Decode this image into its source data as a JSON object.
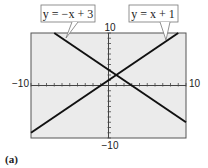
{
  "chart_data": {
    "type": "line",
    "title": "",
    "xlabel": "",
    "ylabel": "",
    "xlim": [
      -10,
      10
    ],
    "ylim": [
      -10,
      10
    ],
    "grid": false,
    "tick_labels": {
      "x_min": "−10",
      "x_max": "10",
      "y_min": "−10",
      "y_max": "10"
    },
    "series": [
      {
        "name": "y = −x + 3",
        "slope": -1,
        "intercept": 3,
        "x": [
          -7,
          10
        ],
        "y": [
          10,
          -7
        ]
      },
      {
        "name": "y = x + 1",
        "slope": 1,
        "intercept": 1,
        "x": [
          -10,
          9
        ],
        "y": [
          -9,
          10
        ]
      }
    ],
    "annotations": [
      "y = −x + 3",
      "y = x + 1"
    ],
    "caption": "(a)"
  },
  "labels": {
    "eq1": "y = −x + 3",
    "eq2": "y = x + 1",
    "xmin": "−10",
    "xmax": "10",
    "ymin": "−10",
    "ymax": "10",
    "caption": "(a)"
  }
}
